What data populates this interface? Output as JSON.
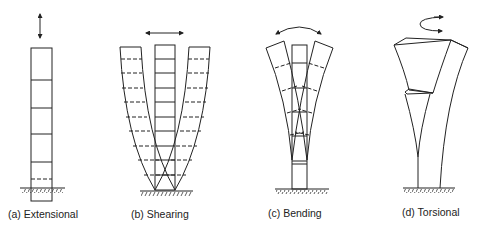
{
  "figure": {
    "panels": [
      {
        "id": "a",
        "label": "(a) Extensional",
        "motion": "vertical double arrow"
      },
      {
        "id": "b",
        "label": "(b) Shearing",
        "motion": "horizontal double arrow"
      },
      {
        "id": "c",
        "label": "(c) Bending",
        "motion": "curved double arrow"
      },
      {
        "id": "d",
        "label": "(d) Torsional",
        "motion": "rotation arrow"
      }
    ],
    "colors": {
      "stroke": "#222222",
      "background": "#ffffff"
    }
  }
}
